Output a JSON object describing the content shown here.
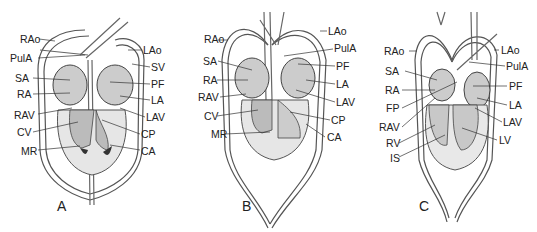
{
  "figure": {
    "panels": [
      {
        "letter": "A",
        "labels_left": [
          "RAo",
          "PulA",
          "SA",
          "RA",
          "RAV",
          "CV",
          "MR"
        ],
        "labels_right": [
          "LAo",
          "SV",
          "PF",
          "LA",
          "LAV",
          "CP",
          "CA"
        ]
      },
      {
        "letter": "B",
        "labels_left": [
          "RAo",
          "SA",
          "RA",
          "RAV",
          "CV",
          "MR"
        ],
        "labels_right": [
          "LAo",
          "PulA",
          "PF",
          "LA",
          "LAV",
          "CP",
          "CA"
        ]
      },
      {
        "letter": "C",
        "labels_left": [
          "RAo",
          "SA",
          "RA",
          "FP",
          "RAV",
          "RV",
          "IS"
        ],
        "labels_right": [
          "LAo",
          "PulA",
          "PF",
          "LA",
          "LAV",
          "LV"
        ]
      }
    ]
  }
}
